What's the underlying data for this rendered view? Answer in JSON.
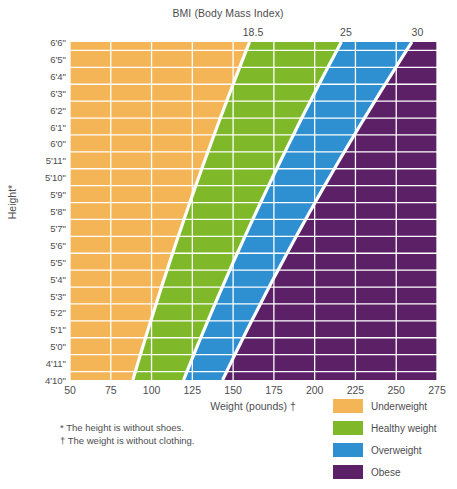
{
  "chart_data": {
    "type": "area",
    "title": "BMI (Body Mass Index)",
    "xlabel": "Weight (pounds) †",
    "ylabel": "Height*",
    "xlim": [
      50,
      275
    ],
    "ylim_inches": [
      58,
      78
    ],
    "grid": true,
    "legend_position": "bottom-right",
    "x_ticks": [
      50,
      75,
      100,
      125,
      150,
      175,
      200,
      225,
      250,
      275
    ],
    "x_tick_labels": [
      "50",
      "75",
      "100",
      "125",
      "150",
      "175",
      "200",
      "225",
      "250",
      "275"
    ],
    "y_tick_labels": [
      "6'6\"",
      "6'5\"",
      "6'4\"",
      "6'3\"",
      "6'2\"",
      "6'1\"",
      "6'0\"",
      "5'11\"",
      "5'10\"",
      "5'9\"",
      "5'8\"",
      "5'7\"",
      "5'6\"",
      "5'5\"",
      "5'4\"",
      "5'3\"",
      "5'2\"",
      "5'1\"",
      "5'0\"",
      "4'11\"",
      "4'10\""
    ],
    "y_tick_inches": [
      78,
      77,
      76,
      75,
      74,
      73,
      72,
      71,
      70,
      69,
      68,
      67,
      66,
      65,
      64,
      63,
      62,
      61,
      60,
      59,
      58
    ],
    "bmi_boundaries": [
      18.5,
      25,
      30
    ],
    "bmi_boundary_labels": [
      "18.5",
      "25",
      "30"
    ],
    "bands": [
      {
        "name": "Underweight",
        "bmi_range": [
          0,
          18.5
        ],
        "color": "#f4b557"
      },
      {
        "name": "Healthy weight",
        "bmi_range": [
          18.5,
          25
        ],
        "color": "#7fb929"
      },
      {
        "name": "Overweight",
        "bmi_range": [
          25,
          30
        ],
        "color": "#2e90d0"
      },
      {
        "name": "Obese",
        "bmi_range": [
          30,
          100
        ],
        "color": "#5c2067"
      }
    ],
    "boundary_weights_lbs": {
      "18.5": {
        "58in": 88.5,
        "78in": 160.1
      },
      "25": {
        "58in": 119.6,
        "78in": 216.3
      },
      "30": {
        "58in": 143.5,
        "78in": 259.6
      }
    },
    "colors": {
      "underweight": "#f4b557",
      "healthy": "#7fb929",
      "overweight": "#2e90d0",
      "obese": "#5c2067",
      "gridline": "#ffffff",
      "boundary_line": "#ffffff",
      "plot_background": "#f6f6f6",
      "text": "#4d4d4f"
    }
  },
  "title": "BMI (Body Mass Index)",
  "bmi_ticks": [
    {
      "label": "18.5",
      "value": 18.5
    },
    {
      "label": "25",
      "value": 25
    },
    {
      "label": "30",
      "value": 30
    }
  ],
  "axes": {
    "x_label": "Weight (pounds) †",
    "y_label": "Height*"
  },
  "footnotes": [
    "* The height is without shoes.",
    "† The weight is without clothing."
  ],
  "legend": {
    "items": [
      {
        "label": "Underweight",
        "color": "#f4b557"
      },
      {
        "label": "Healthy weight",
        "color": "#7fb929"
      },
      {
        "label": "Overweight",
        "color": "#2e90d0"
      },
      {
        "label": "Obese",
        "color": "#5c2067"
      }
    ]
  }
}
